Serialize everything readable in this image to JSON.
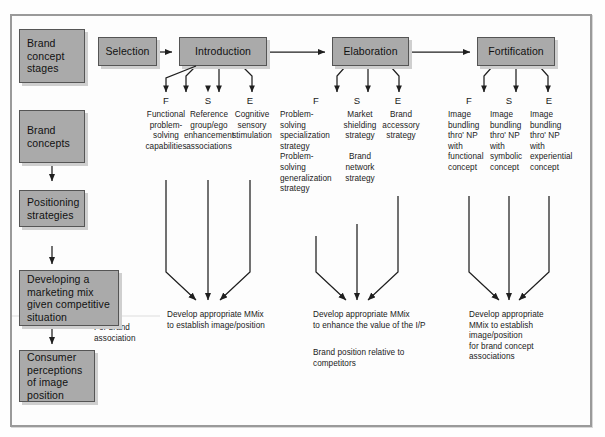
{
  "diagram": {
    "colors": {
      "box_fill": "#aaaaaa",
      "box_border": "#555555",
      "shadow": "#cfcfcf",
      "line": "#1f1f1f",
      "frame": "#9a9a9a"
    },
    "left_column": [
      {
        "id": "brand-concept-stages",
        "label": "Brand\nconcept\nstages"
      },
      {
        "id": "brand-concepts",
        "label": "Brand\nconcepts"
      },
      {
        "id": "positioning-strategies",
        "label": "Positioning\nstrategies"
      },
      {
        "id": "developing-marketing-mix",
        "label": "Developing a\nmarketing mix\ngiven competitive\nsituation"
      },
      {
        "id": "consumer-perceptions",
        "label": "Consumer\nperceptions\nof image\nposition"
      }
    ],
    "stage_boxes": [
      {
        "id": "selection",
        "label": "Selection"
      },
      {
        "id": "introduction",
        "label": "Introduction"
      },
      {
        "id": "elaboration",
        "label": "Elaboration"
      },
      {
        "id": "fortification",
        "label": "Fortification"
      }
    ],
    "branch_groups": [
      {
        "stage": "Introduction",
        "branches": [
          {
            "code": "F",
            "text": "Functional\nproblem-\nsolving\ncapabilities"
          },
          {
            "code": "S",
            "text": "Reference\ngroup/ego\nenhancement\nassociations"
          },
          {
            "code": "E",
            "text": "Cognitive\nsensory\nstimulation"
          }
        ],
        "outcomes": [
          "Develop appropriate MMix\nto establish image/position"
        ]
      },
      {
        "stage": "Elaboration",
        "branches": [
          {
            "code": "F",
            "text": "Problem-\nsolving\nspecialization\nstrategy\nProblem-\nsolving\ngeneralization\nstrategy"
          },
          {
            "code": "S",
            "text": "Market\nshielding\nstrategy\n\nBrand\nnetwork\nstrategy"
          },
          {
            "code": "E",
            "text": "Brand\naccessory\nstrategy"
          }
        ],
        "outcomes": [
          "Develop appropriate MMix\nto enhance the value of the I/P",
          "Brand position relative to\ncompetitors"
        ]
      },
      {
        "stage": "Fortification",
        "branches": [
          {
            "code": "F",
            "text": "Image\nbundling\nthro' NP\nwith\nfunctional\nconcept"
          },
          {
            "code": "S",
            "text": "Image\nbundling\nthro' NP\nwith\nsymbolic\nconcept"
          },
          {
            "code": "E",
            "text": "Image\nbundling\nthro' NP\nwith\nexperiential\nconcept"
          }
        ],
        "outcomes": [
          "Develop appropriate\nMMix to establish\nimage/position\nfor brand concept\nassociations"
        ]
      }
    ],
    "annotations": [
      {
        "id": "for-brand-association",
        "text": "For brand\nassociation"
      }
    ]
  }
}
